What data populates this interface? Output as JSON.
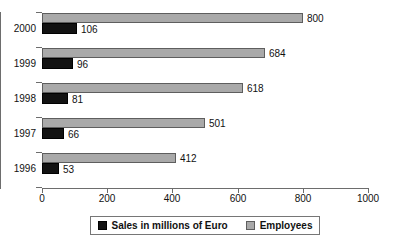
{
  "chart_data": {
    "type": "bar",
    "orientation": "horizontal",
    "title": "",
    "subtitle": "",
    "xlabel": "",
    "ylabel": "",
    "categories": [
      "2000",
      "1999",
      "1998",
      "1997",
      "1996"
    ],
    "series": [
      {
        "name": "Sales in millions of Euro",
        "color": "#121212",
        "values": [
          106,
          96,
          81,
          66,
          53
        ]
      },
      {
        "name": "Employees",
        "color": "#a9a9a9",
        "values": [
          800,
          684,
          618,
          501,
          412
        ]
      }
    ],
    "xlim": [
      0,
      1000
    ],
    "xticks": [
      0,
      200,
      400,
      600,
      800,
      1000
    ],
    "xtick_labels": [
      "0",
      "200",
      "400",
      "600",
      "800",
      "1000"
    ],
    "grid": false,
    "legend_position": "bottom",
    "data_labels": true,
    "annotations": []
  },
  "axis": {
    "ticks": [
      {
        "label": "0",
        "value": 0
      },
      {
        "label": "200",
        "value": 200
      },
      {
        "label": "400",
        "value": 400
      },
      {
        "label": "600",
        "value": 600
      },
      {
        "label": "800",
        "value": 800
      },
      {
        "label": "1000",
        "value": 1000
      }
    ]
  },
  "categories": [
    {
      "label": "2000",
      "employees": {
        "value": 800,
        "label": "800"
      },
      "sales": {
        "value": 106,
        "label": "106"
      }
    },
    {
      "label": "1999",
      "employees": {
        "value": 684,
        "label": "684"
      },
      "sales": {
        "value": 96,
        "label": "96"
      }
    },
    {
      "label": "1998",
      "employees": {
        "value": 618,
        "label": "618"
      },
      "sales": {
        "value": 81,
        "label": "81"
      }
    },
    {
      "label": "1997",
      "employees": {
        "value": 501,
        "label": "501"
      },
      "sales": {
        "value": 66,
        "label": "66"
      }
    },
    {
      "label": "1996",
      "employees": {
        "value": 412,
        "label": "412"
      },
      "sales": {
        "value": 53,
        "label": "53"
      }
    }
  ],
  "legend": {
    "entries": [
      {
        "label": "Sales in millions of Euro",
        "swatch": "sales",
        "color": "#121212"
      },
      {
        "label": "Employees",
        "swatch": "employees",
        "color": "#a9a9a9"
      }
    ]
  }
}
